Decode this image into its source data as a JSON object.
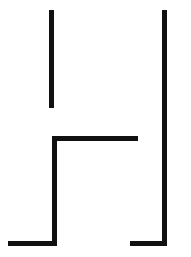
{
  "figure": {
    "kind": "line-drawing",
    "canvas": {
      "width": 191,
      "height": 257,
      "background_color": "#ffffff"
    },
    "style": {
      "stroke_color": "#111111",
      "stroke_thickness": 5,
      "line_cap": "butt",
      "line_join": "miter"
    },
    "strokes": [
      {
        "name": "upper-left-vertical",
        "orientation": "vertical",
        "x": 49,
        "y": 10,
        "width": 5,
        "height": 98,
        "x1": 51.5,
        "y1": 10,
        "x2": 51.5,
        "y2": 108
      },
      {
        "name": "right-vertical",
        "orientation": "vertical",
        "x": 162,
        "y": 10,
        "width": 5,
        "height": 236,
        "x1": 164.5,
        "y1": 10,
        "x2": 164.5,
        "y2": 246
      },
      {
        "name": "middle-horizontal",
        "orientation": "horizontal",
        "x": 52,
        "y": 136,
        "width": 86,
        "height": 5,
        "x1": 52,
        "y1": 138.5,
        "x2": 138,
        "y2": 138.5
      },
      {
        "name": "lower-left-vertical",
        "orientation": "vertical",
        "x": 52,
        "y": 136,
        "width": 5,
        "height": 110,
        "x1": 54.5,
        "y1": 136,
        "x2": 54.5,
        "y2": 246
      },
      {
        "name": "bottom-left-horizontal",
        "orientation": "horizontal",
        "x": 8,
        "y": 241,
        "width": 49,
        "height": 5,
        "x1": 8,
        "y1": 243.5,
        "x2": 57,
        "y2": 243.5
      },
      {
        "name": "bottom-right-horizontal",
        "orientation": "horizontal",
        "x": 130,
        "y": 241,
        "width": 37,
        "height": 5,
        "x1": 130,
        "y1": 243.5,
        "x2": 167,
        "y2": 243.5
      }
    ],
    "segment_count": 6,
    "colors": {
      "ink": "#111111",
      "paper": "#ffffff"
    }
  }
}
